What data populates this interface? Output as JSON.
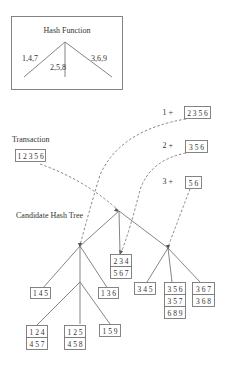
{
  "hash_function": {
    "title": "Hash Function",
    "branches": [
      "1,4,7",
      "2,5,8",
      "3,6,9"
    ]
  },
  "transaction": {
    "label": "Transaction",
    "items": "1 2 3 5 6"
  },
  "prefixes": [
    {
      "prefix": "1 +",
      "rest": "2 3 5 6"
    },
    {
      "prefix": "2 +",
      "rest": "3 5 6"
    },
    {
      "prefix": "3 +",
      "rest": "5 6"
    }
  ],
  "tree": {
    "label": "Candidate Hash Tree",
    "leaves": {
      "mid": [
        "2 3 4",
        "5 6 7"
      ],
      "l_left": [
        "1 4 5"
      ],
      "l_right": [
        "1 3 6"
      ],
      "ll_a": [
        "1 2 4",
        "4 5 7"
      ],
      "ll_b": [
        "1 2 5",
        "4 5 8"
      ],
      "ll_c": [
        "1 5 9"
      ],
      "r_a": [
        "3 4 5"
      ],
      "r_b": [
        "3 5 6",
        "3 5 7",
        "6 8 9"
      ],
      "r_c": [
        "3 6 7",
        "3 6 8"
      ]
    }
  }
}
